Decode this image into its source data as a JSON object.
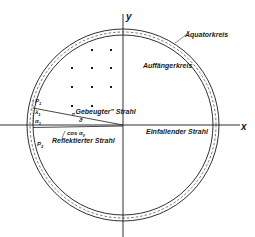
{
  "figure": {
    "axes": {
      "x_label": "x",
      "y_label": "y"
    },
    "circles": {
      "outer": "Äquatorkreis",
      "inner": "Auffängerkreis"
    },
    "rays": {
      "incident": "Einfallender Strahl",
      "diffracted": "„Gebeugter\" Strahl",
      "reflected": "Reflektierter Strahl"
    },
    "symbols": {
      "theta": "ϑ",
      "cos_alpha": "cos α",
      "cos_alpha_sub": "0",
      "p1": "P",
      "p1_sub": "1",
      "p2": "P",
      "p2_sub": "2",
      "lambda1": "λ",
      "lambda1_sub": "1",
      "alpha1": "α",
      "alpha1_sub": "1"
    },
    "lattice_points": [
      [
        92,
        50
      ],
      [
        111,
        50
      ],
      [
        72,
        68
      ],
      [
        92,
        68
      ],
      [
        111,
        68
      ],
      [
        72,
        87
      ],
      [
        92,
        87
      ],
      [
        111,
        87
      ],
      [
        72,
        106
      ],
      [
        92,
        106
      ]
    ],
    "colors": {
      "ink": "#1a1a1a",
      "background": "#ffffff"
    }
  }
}
